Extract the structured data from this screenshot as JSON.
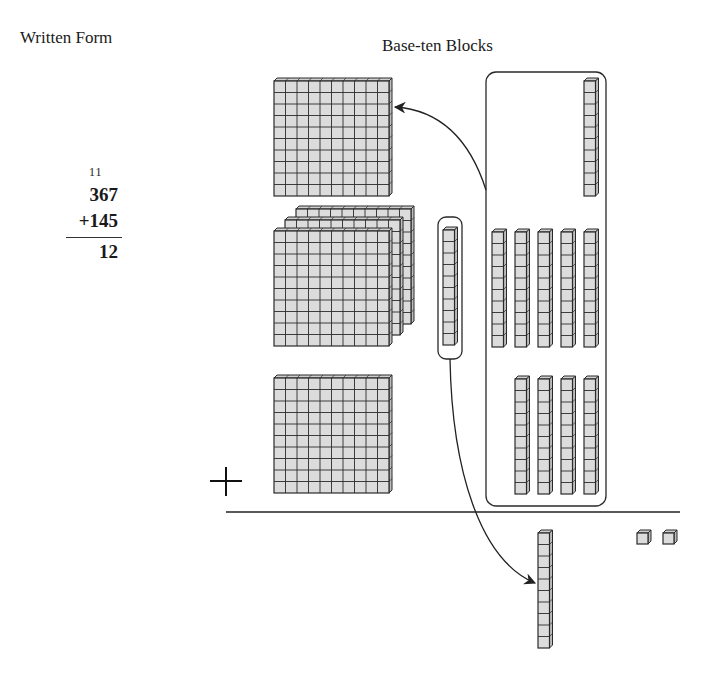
{
  "headings": {
    "written_form": "Written Form",
    "base_ten_blocks": "Base-ten Blocks"
  },
  "written": {
    "carry_digits": "11",
    "addend_1": "367",
    "addend_2": "+145",
    "partial_sum": "12"
  },
  "blocks": {
    "flats_top_addend": 3,
    "flats_bottom_addend": 1,
    "regrouped_flat_from_tens": 1,
    "rods_in_box_upper": 1,
    "rods_in_box_middle": 5,
    "rods_in_box_lower": 4,
    "rods_circled": 1,
    "rods_result": 1,
    "units_result": 2
  },
  "symbols": {
    "plus": "+"
  },
  "colors": {
    "block_fill": "#dcdcdc",
    "block_side": "#bdbdbd",
    "block_top": "#cfcfcf",
    "stroke": "#2a2a2a"
  }
}
